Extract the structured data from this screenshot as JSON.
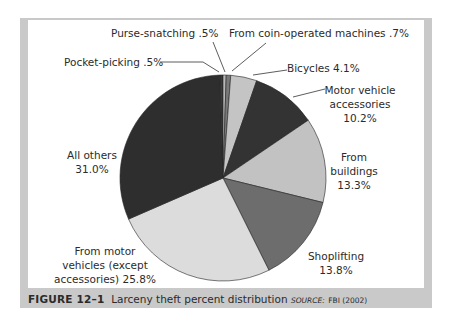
{
  "chart_data": {
    "type": "pie",
    "title": "Larceny theft percent distribution",
    "figure_label": "FIGURE 12–1",
    "source": "FBI (2002)",
    "categories": [
      "Pocket-picking",
      "Purse-snatching",
      "From coin-operated machines",
      "Bicycles",
      "Motor vehicle accessories",
      "From buildings",
      "Shoplifting",
      "From motor vehicles (except accessories)",
      "All others"
    ],
    "values": [
      0.5,
      0.5,
      0.7,
      4.1,
      10.2,
      13.3,
      13.8,
      25.8,
      31.0
    ],
    "colors": [
      "#3a3a3a",
      "#b8b8b8",
      "#7a7a7a",
      "#c4c4c4",
      "#333333",
      "#c2c2c2",
      "#6d6d6d",
      "#dcdcdc",
      "#2e2e2e"
    ],
    "legend": "none (direct labels)",
    "start_angle": "12 o'clock, clockwise after Pocket-picking/Purse-snatching near top"
  },
  "labels": {
    "purse": "Purse-snatching .5%",
    "coin": "From coin-operated machines .7%",
    "pocket": "Pocket-picking .5%",
    "bicycles": "Bicycles 4.1%",
    "mva_1": "Motor vehicle",
    "mva_2": "accessories",
    "mva_3": "10.2%",
    "buildings_1": "From",
    "buildings_2": "buildings",
    "buildings_3": "13.3%",
    "shoplifting_1": "Shoplifting",
    "shoplifting_2": "13.8%",
    "motor_1": "From motor",
    "motor_2": "vehicles (except",
    "motor_3": "accessories) 25.8%",
    "others_1": "All others",
    "others_2": "31.0%"
  },
  "caption": {
    "figure": "FIGURE 12–1",
    "title": "Larceny theft percent distribution",
    "source_label": "SOURCE:",
    "source": "FBI (2002)"
  }
}
